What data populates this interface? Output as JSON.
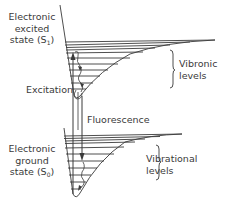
{
  "diagram": {
    "type": "jablonski-energy-diagram",
    "excited_state": {
      "line1": "Electronic",
      "line2": "excited",
      "line3_prefix": "state (S",
      "subscript": "1",
      "line3_suffix": ")"
    },
    "ground_state": {
      "line1": "Electronic",
      "line2": "ground",
      "line3_prefix": "state (S",
      "subscript": "0",
      "line3_suffix": ")"
    },
    "vibronic_levels": {
      "line1": "Vibronic",
      "line2": "levels"
    },
    "vibrational_levels": {
      "line1": "Vibrational",
      "line2": "levels"
    },
    "excitation_label": "Excitation",
    "fluorescence_label": "Fluorescence",
    "colors": {
      "stroke": "#3a3a3a",
      "background": "#ffffff"
    }
  }
}
